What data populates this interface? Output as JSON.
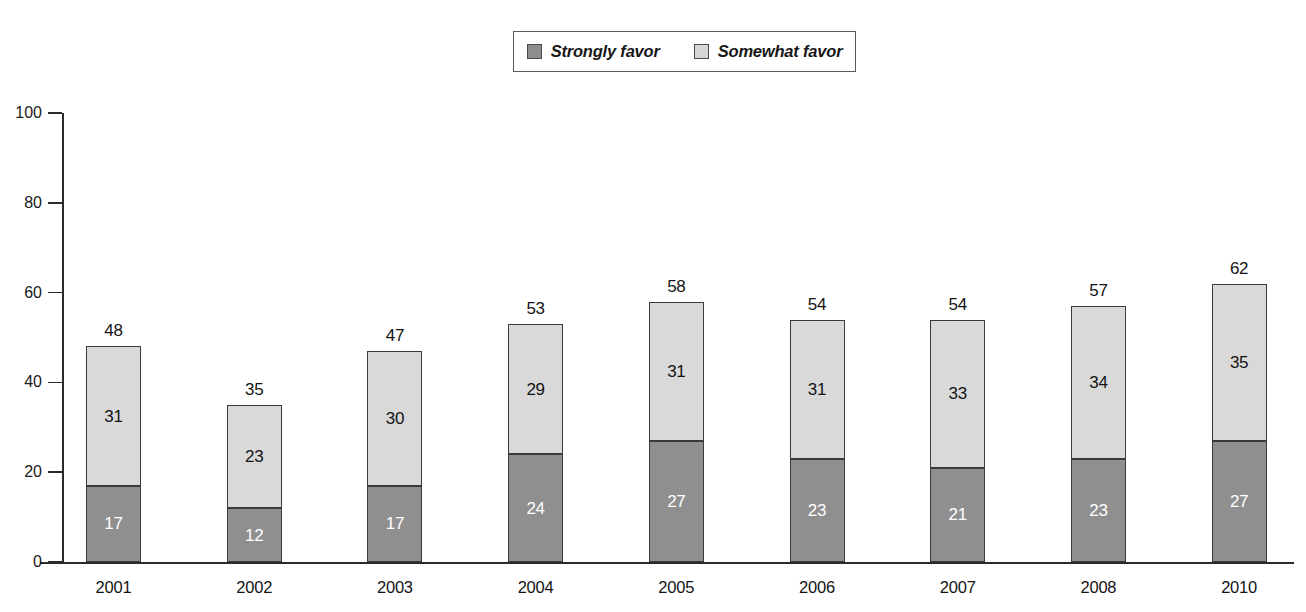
{
  "legend": {
    "entries": [
      {
        "label": "Strongly favor",
        "swatch": "dark-gray-square-icon",
        "color": "#8d8d8d"
      },
      {
        "label": "Somewhat favor",
        "swatch": "light-gray-square-icon",
        "color": "#d6d6d6"
      }
    ]
  },
  "chart_data": {
    "type": "bar",
    "stacked": true,
    "title": "",
    "subtitle": "",
    "xlabel": "",
    "ylabel": "",
    "ylim": [
      0,
      100
    ],
    "yticks": [
      0,
      20,
      40,
      60,
      80,
      100
    ],
    "ytick_labels": [
      "0",
      "20",
      "40",
      "60",
      "80",
      "100"
    ],
    "grid": false,
    "legend_position": "top-center",
    "categories": [
      "2001",
      "2002",
      "2003",
      "2004",
      "2005",
      "2006",
      "2007",
      "2008",
      "2010"
    ],
    "series": [
      {
        "name": "Strongly favor",
        "color": "#8f8f8f",
        "values": [
          17,
          12,
          17,
          24,
          27,
          23,
          21,
          23,
          27
        ]
      },
      {
        "name": "Somewhat favor",
        "color": "#d9d9d9",
        "values": [
          31,
          23,
          30,
          29,
          31,
          31,
          33,
          34,
          35
        ]
      }
    ],
    "totals": [
      48,
      35,
      47,
      53,
      58,
      54,
      54,
      57,
      62
    ]
  }
}
